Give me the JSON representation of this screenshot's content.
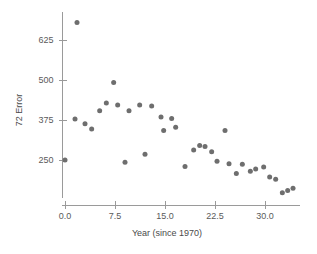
{
  "chart_data": {
    "type": "scatter",
    "title": "",
    "xlabel": "Year (since 1970)",
    "ylabel": "72 Error",
    "xlim": [
      -1.5,
      35.5
    ],
    "ylim": [
      95,
      700
    ],
    "grid": false,
    "legend": null,
    "xticks": [
      "0.0",
      "7.5",
      "15.0",
      "22.5",
      "30.0"
    ],
    "xtick_values": [
      0.0,
      7.5,
      15.0,
      22.5,
      30.0
    ],
    "yticks": [
      "250",
      "375",
      "500",
      "625"
    ],
    "ytick_values": [
      250,
      375,
      500,
      625
    ],
    "marker": {
      "shape": "circle",
      "color": "#6e6e6e",
      "size_px": 5
    },
    "points": [
      {
        "x": 0.0,
        "y": 250
      },
      {
        "x": 1.8,
        "y": 680
      },
      {
        "x": 1.5,
        "y": 378
      },
      {
        "x": 3.0,
        "y": 363
      },
      {
        "x": 4.0,
        "y": 347
      },
      {
        "x": 5.2,
        "y": 404
      },
      {
        "x": 6.2,
        "y": 428
      },
      {
        "x": 7.3,
        "y": 492
      },
      {
        "x": 7.9,
        "y": 422
      },
      {
        "x": 9.0,
        "y": 243
      },
      {
        "x": 9.6,
        "y": 404
      },
      {
        "x": 11.2,
        "y": 422
      },
      {
        "x": 12.0,
        "y": 268
      },
      {
        "x": 13.0,
        "y": 419
      },
      {
        "x": 14.4,
        "y": 384
      },
      {
        "x": 14.8,
        "y": 342
      },
      {
        "x": 16.0,
        "y": 380
      },
      {
        "x": 16.6,
        "y": 352
      },
      {
        "x": 18.0,
        "y": 230
      },
      {
        "x": 19.3,
        "y": 281
      },
      {
        "x": 20.2,
        "y": 295
      },
      {
        "x": 21.0,
        "y": 292
      },
      {
        "x": 22.0,
        "y": 276
      },
      {
        "x": 22.8,
        "y": 246
      },
      {
        "x": 24.0,
        "y": 342
      },
      {
        "x": 24.6,
        "y": 238
      },
      {
        "x": 25.7,
        "y": 208
      },
      {
        "x": 26.6,
        "y": 237
      },
      {
        "x": 27.8,
        "y": 215
      },
      {
        "x": 28.6,
        "y": 222
      },
      {
        "x": 29.8,
        "y": 228
      },
      {
        "x": 30.7,
        "y": 197
      },
      {
        "x": 31.6,
        "y": 190
      },
      {
        "x": 32.6,
        "y": 148
      },
      {
        "x": 33.4,
        "y": 155
      },
      {
        "x": 34.2,
        "y": 162
      }
    ]
  },
  "figure": {
    "background": "#ffffff",
    "axis_color": "#9a9a9a",
    "text_color": "#5a5a5a"
  }
}
